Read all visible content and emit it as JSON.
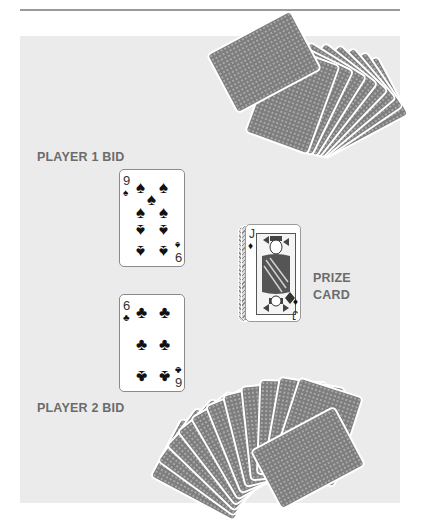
{
  "labels": {
    "player1": "PLAYER 1 BID",
    "player2": "PLAYER 2 BID",
    "prize_line1": "PRIZE",
    "prize_line2": "CARD"
  },
  "player1_card": {
    "rank": "9",
    "suit": "spades",
    "suit_glyph": "♠",
    "rank_bottom": "6"
  },
  "player2_card": {
    "rank": "6",
    "suit": "clubs",
    "suit_glyph": "♣",
    "rank_bottom": "9"
  },
  "prize_card": {
    "rank": "J",
    "suit": "diamonds",
    "suit_glyph": "♦",
    "rank_bottom": "J"
  },
  "colors": {
    "panel": "#ebebeb",
    "label": "#6b6b6b",
    "card_back": "#7d7d7d",
    "rule": "#9a9a9a"
  }
}
